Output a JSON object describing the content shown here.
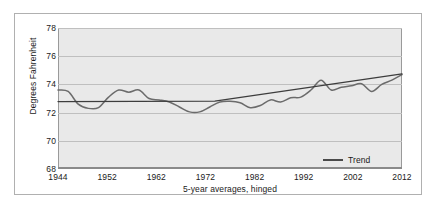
{
  "chart_data": {
    "type": "line",
    "title": "",
    "xlabel": "5-year averages, hinged",
    "ylabel": "Degrees Fahrenheit",
    "xlim": [
      1944,
      2012
    ],
    "ylim": [
      68,
      78
    ],
    "grid": true,
    "background": "#e9e9e9",
    "legend": {
      "position": "inside-bottom-right",
      "entries": [
        {
          "name": "Trend",
          "color": "#4a4a4a",
          "style": "line"
        }
      ]
    },
    "xticks": [
      1944,
      1952,
      1962,
      1972,
      1982,
      1992,
      2002,
      2012
    ],
    "yticks": [
      68,
      70,
      72,
      74,
      76,
      78
    ],
    "series": [
      {
        "name": "5-year average temperature",
        "color": "#6b6b6b",
        "x": [
          1944,
          1946,
          1948,
          1950,
          1952,
          1954,
          1956,
          1958,
          1960,
          1962,
          1964,
          1966,
          1968,
          1970,
          1972,
          1974,
          1976,
          1978,
          1980,
          1982,
          1984,
          1986,
          1988,
          1990,
          1992,
          1994,
          1996,
          1998,
          2000,
          2002,
          2004,
          2006,
          2008,
          2010,
          2012
        ],
        "values": [
          73.6,
          73.5,
          72.6,
          72.3,
          72.35,
          73.1,
          73.6,
          73.45,
          73.6,
          73.0,
          72.9,
          72.75,
          72.4,
          72.05,
          72.05,
          72.4,
          72.75,
          72.8,
          72.7,
          72.35,
          72.5,
          72.9,
          72.75,
          73.05,
          73.1,
          73.6,
          74.3,
          73.6,
          73.8,
          73.9,
          74.05,
          73.5,
          74.0,
          74.3,
          74.7
        ]
      },
      {
        "name": "Trend",
        "color": "#3d3d3d",
        "x": [
          1944,
          1975,
          2012
        ],
        "values": [
          72.78,
          72.82,
          74.75
        ],
        "note": "hinged piecewise-linear trend: flat to ~1975 then rising"
      }
    ]
  }
}
